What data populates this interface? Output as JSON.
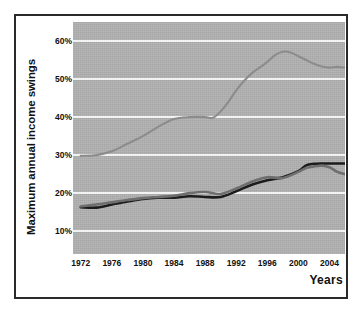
{
  "chart_data": {
    "type": "line",
    "title": "",
    "subtitle": "",
    "xlabel": "Years",
    "ylabel": "Maximum annual income swings",
    "xlim": [
      1971,
      2006
    ],
    "ylim": [
      4,
      65
    ],
    "grid": true,
    "grid_color": "#f2f2f2",
    "plot_background": "#b2b2b2",
    "legend": "none",
    "y_tick_labels": [
      "60%",
      "50%",
      "40%",
      "30%",
      "20%",
      "10%"
    ],
    "y_tick_values": [
      60,
      50,
      40,
      30,
      20,
      10
    ],
    "x_tick_labels": [
      "1972",
      "1976",
      "1980",
      "1984",
      "1988",
      "1992",
      "1996",
      "2000",
      "2004"
    ],
    "x_tick_values": [
      1972,
      1976,
      1980,
      1984,
      1988,
      1992,
      1996,
      2000,
      2004
    ],
    "series": [
      {
        "name": "upper-series",
        "color": "#8c8c8c",
        "x": [
          1972,
          1974,
          1976,
          1978,
          1980,
          1982,
          1984,
          1986,
          1988,
          1989,
          1990,
          1991,
          1992,
          1993,
          1994,
          1995,
          1996,
          1997,
          1998,
          1999,
          2000,
          2001,
          2002,
          2003,
          2004,
          2005,
          2006
        ],
        "values": [
          29.8,
          30.0,
          31.0,
          33.0,
          35.0,
          37.5,
          39.5,
          40.0,
          40.0,
          39.8,
          41.5,
          44.0,
          47.0,
          49.5,
          51.5,
          53.0,
          54.5,
          56.3,
          57.2,
          57.0,
          56.0,
          55.0,
          54.0,
          53.3,
          53.0,
          53.2,
          53.0
        ]
      },
      {
        "name": "lower-series-dark",
        "color": "#1c1c1c",
        "x": [
          1972,
          1974,
          1976,
          1978,
          1980,
          1982,
          1984,
          1986,
          1988,
          1990,
          1992,
          1994,
          1996,
          1998,
          2000,
          2001,
          2002,
          2003,
          2004,
          2005,
          2006
        ],
        "values": [
          16.3,
          16.2,
          17.0,
          17.8,
          18.5,
          18.8,
          18.8,
          19.2,
          19.0,
          19.0,
          20.5,
          22.2,
          23.4,
          24.2,
          25.8,
          27.3,
          27.7,
          27.8,
          27.8,
          27.8,
          27.8
        ]
      },
      {
        "name": "lower-series-gray",
        "color": "#6e6e6e",
        "x": [
          1972,
          1974,
          1976,
          1978,
          1980,
          1982,
          1984,
          1986,
          1988,
          1990,
          1992,
          1994,
          1996,
          1998,
          2000,
          2001,
          2002,
          2003,
          2004,
          2005,
          2006
        ],
        "values": [
          16.5,
          17.0,
          17.6,
          18.2,
          18.7,
          19.0,
          19.3,
          20.0,
          20.3,
          19.8,
          21.2,
          23.0,
          24.2,
          24.0,
          25.6,
          26.6,
          27.0,
          27.2,
          26.8,
          25.6,
          25.0
        ]
      }
    ]
  }
}
